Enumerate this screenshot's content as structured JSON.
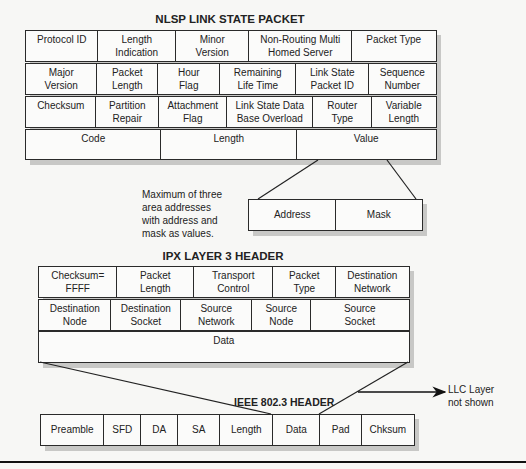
{
  "nlsp": {
    "title": "NLSP LINK STATE PACKET",
    "row1": [
      "Protocol ID",
      "Length\nIndication",
      "Minor\nVersion",
      "Non-Routing Multi\nHomed Server",
      "Packet Type"
    ],
    "row2": [
      "Major\nVersion",
      "Packet\nLength",
      "Hour\nFlag",
      "Remaining\nLife Time",
      "Link State\nPacket ID",
      "Sequence\nNumber"
    ],
    "row3": [
      "Checksum",
      "Partition\nRepair",
      "Attachment\nFlag",
      "Link State Data\nBase Overload",
      "Router\nType",
      "Variable\nLength"
    ],
    "row4": [
      "Code",
      "Length",
      "Value"
    ]
  },
  "value_detail": {
    "cells": [
      "Address",
      "Mask"
    ],
    "note": "Maximum of three\narea addresses\nwith address and\nmask as values."
  },
  "ipx": {
    "title": "IPX LAYER 3 HEADER",
    "row1": [
      "Checksum=\nFFFF",
      "Packet\nLength",
      "Transport\nControl",
      "Packet\nType",
      "Destination\nNetwork"
    ],
    "row2": [
      "Destination\nNode",
      "Destination\nSocket",
      "Source\nNetwork",
      "Source\nNode",
      "Source\nSocket"
    ],
    "row3": [
      "Data"
    ]
  },
  "ieee": {
    "title": "IEEE 802.3 HEADER",
    "row": [
      "Preamble",
      "SFD",
      "DA",
      "SA",
      "Length",
      "Data",
      "Pad",
      "Chksum"
    ],
    "llc_note": "LLC Layer\nnot shown"
  }
}
